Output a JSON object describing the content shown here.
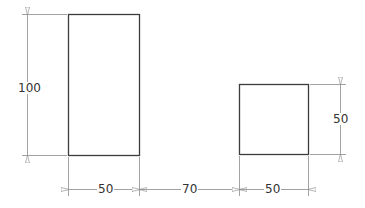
{
  "drawing": {
    "colors": {
      "outline": "#3c3c3c",
      "dimension": "#8a8a8a",
      "text": "#333333",
      "background": "#ffffff"
    },
    "shapes": [
      {
        "name": "tall-rectangle",
        "width": 50,
        "height": 100
      },
      {
        "name": "square",
        "width": 50,
        "height": 50
      }
    ],
    "dimensions": {
      "tall_height": "100",
      "tall_width": "50",
      "gap": "70",
      "square_width": "50",
      "square_height": "50"
    }
  }
}
